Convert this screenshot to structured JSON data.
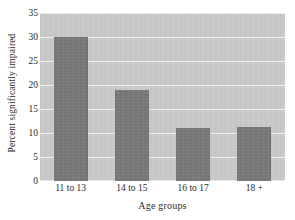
{
  "chart_data": {
    "type": "bar",
    "title": "",
    "subtitle": "",
    "xlabel": "Age groups",
    "ylabel": "Percent significantly impaired",
    "categories": [
      "11 to 13",
      "14 to 15",
      "16 to 17",
      "18 +"
    ],
    "values": [
      30.1,
      18.9,
      11.1,
      11.3
    ],
    "series": [
      {
        "name": "Percent significantly impaired",
        "values": [
          30.1,
          18.9,
          11.1,
          11.3
        ]
      }
    ],
    "ylim": [
      0,
      35
    ],
    "yticks": [
      0,
      5,
      10,
      15,
      20,
      25,
      30,
      35
    ],
    "ytick_labels": [
      "0",
      "5",
      "10",
      "15",
      "20",
      "25",
      "30",
      "35"
    ],
    "grid": true,
    "grid_axis": "y",
    "legend": false,
    "legend_position": "none",
    "annotations": []
  },
  "style": {
    "bar_color": "#787878",
    "plot_background": "#c9c9c9",
    "page_background": "#ffffff",
    "gridline_color": "#f2f2f2",
    "text_color": "#2b2b2b"
  }
}
